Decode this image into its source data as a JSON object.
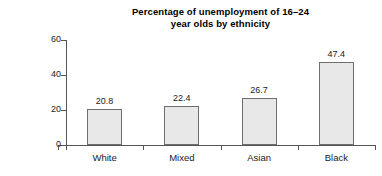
{
  "chart_data": {
    "type": "bar",
    "title": "Percentage of unemployment of 16–24 year olds by ethnicity",
    "title_lines": [
      "Percentage of unemployment of 16–24",
      "year olds by ethnicity"
    ],
    "categories": [
      "White",
      "Mixed",
      "Asian",
      "Black"
    ],
    "values": [
      20.8,
      22.4,
      26.7,
      47.4
    ],
    "value_labels": [
      "20.8",
      "22.4",
      "26.7",
      "47.4"
    ],
    "xlabel": "",
    "ylabel": "",
    "ylim": [
      0,
      60
    ],
    "yticks": [
      0,
      20,
      40,
      60
    ],
    "ytick_labels": [
      "0",
      "20",
      "40",
      "60"
    ],
    "grid": false,
    "legend": false,
    "bar_color": "#e8e8e8",
    "bar_border_color": "#6e6e6e",
    "axis_color": "#555555",
    "text_color": "#1a1a1a",
    "background": "#ffffff"
  }
}
